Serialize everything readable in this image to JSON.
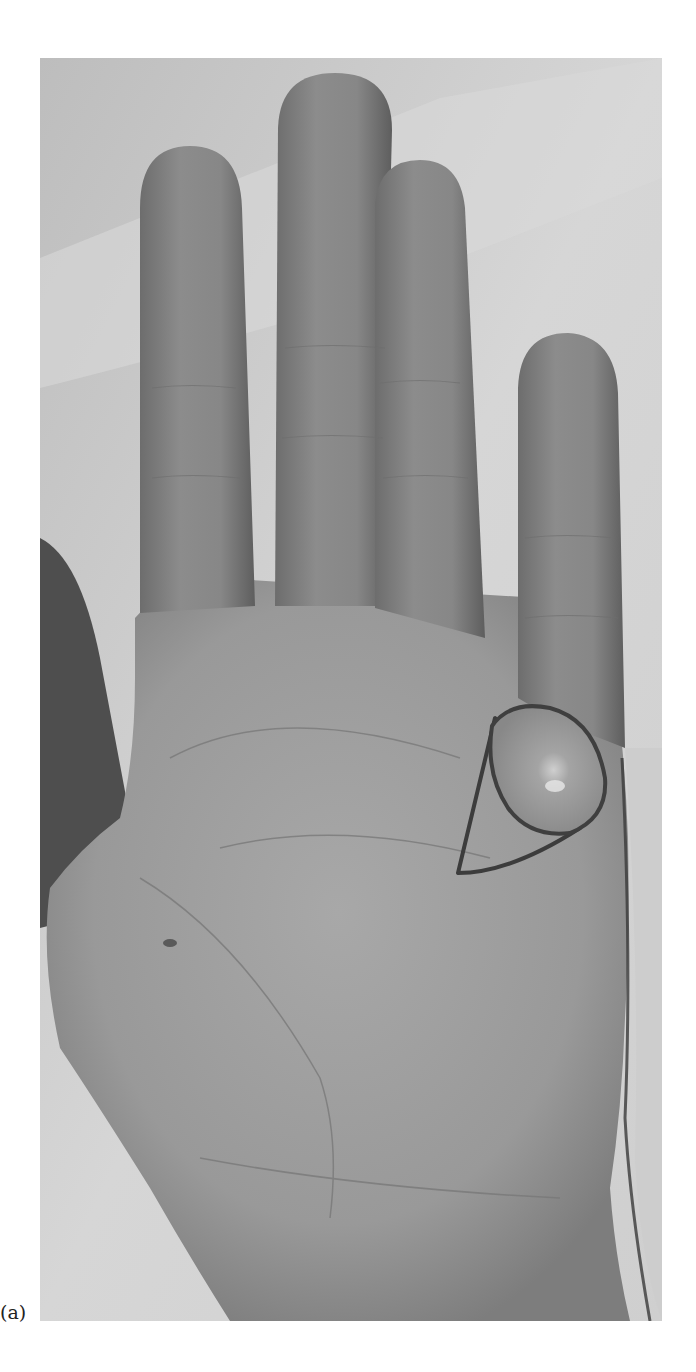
{
  "figure": {
    "panel_label": "(a)",
    "image_mode": "grayscale photograph",
    "annotations": [
      {
        "type": "lesion",
        "shape": "oval cyst",
        "location": "base of little finger, palm side"
      },
      {
        "type": "surgical marking",
        "shape": "triangular incision outline",
        "location": "surrounding lesion"
      }
    ],
    "colors": {
      "background_sheet": "#d2d2d2",
      "skin_mid": "#8e8e8e",
      "skin_light": "#a9a9a9",
      "skin_dark": "#6a6a6a",
      "marking": "#3c3c3c",
      "page": "#ffffff"
    }
  }
}
